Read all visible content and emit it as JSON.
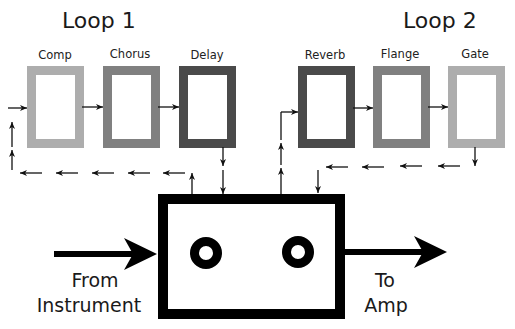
{
  "loops": [
    {
      "title": "Loop 1",
      "effects": [
        {
          "label": "Comp",
          "color": "#adadad"
        },
        {
          "label": "Chorus",
          "color": "#808080"
        },
        {
          "label": "Delay",
          "color": "#4a4a4a"
        }
      ]
    },
    {
      "title": "Loop 2",
      "effects": [
        {
          "label": "Reverb",
          "color": "#4a4a4a"
        },
        {
          "label": "Flange",
          "color": "#808080"
        },
        {
          "label": "Gate",
          "color": "#adadad"
        }
      ]
    }
  ],
  "input_label": [
    "From",
    "Instrument"
  ],
  "output_label": [
    "To",
    "Amp"
  ],
  "switcher": {
    "jacks": 2,
    "color": "#000000"
  }
}
